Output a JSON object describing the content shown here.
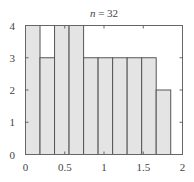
{
  "chart_data": {
    "type": "bar",
    "subtype": "histogram",
    "title": "n = 32",
    "title_var": "n",
    "title_value": "32",
    "xlabel": "",
    "ylabel": "",
    "xlim": [
      0,
      2
    ],
    "ylim": [
      0,
      4
    ],
    "xticks": [
      "0",
      "0.5",
      "1",
      "1.5",
      "2"
    ],
    "xtick_values": [
      0,
      0.5,
      1,
      1.5,
      2
    ],
    "yticks": [
      "0",
      "1",
      "2",
      "3",
      "4"
    ],
    "ytick_values": [
      0,
      1,
      2,
      3,
      4
    ],
    "bin_edges": [
      0,
      0.185,
      0.37,
      0.555,
      0.74,
      0.925,
      1.11,
      1.295,
      1.48,
      1.665,
      1.85
    ],
    "values": [
      4,
      3,
      4,
      4,
      3,
      3,
      3,
      3,
      3,
      2
    ],
    "grid": false,
    "legend": null,
    "bar_fill": "#e4e4e4",
    "bar_edge": "#555555",
    "axis_color": "#666666"
  }
}
